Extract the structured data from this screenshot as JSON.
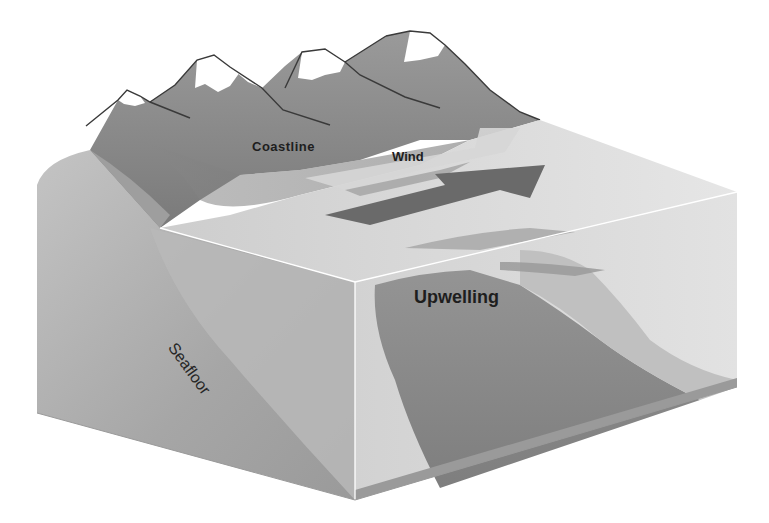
{
  "diagram": {
    "type": "3d-block-diagram",
    "labels": {
      "coastline": "Coastline",
      "wind": "Wind",
      "upwelling": "Upwelling",
      "seafloor": "Seafloor"
    },
    "colors": {
      "background": "#ffffff",
      "mountain": "#8e8e8e",
      "mountain_snow": "#ffffff",
      "mountain_outline": "#3a3a3a",
      "slope_left": "#a8a8a8",
      "slope_shadow": "#7c7c7c",
      "water_surface": "#dadada",
      "water_front_face": "#c9c9c9",
      "water_right_face": "#dedede",
      "wind_arrow": "#6a6a6a",
      "wind_arrow_light": "#d9d9d9",
      "upwelling_plume": "#8a8a8a",
      "upwelling_flow": "#a0a0a0",
      "seafloor_floor": "#b2b2b2",
      "edge_line": "#ffffff",
      "text": "#1e1e1e"
    },
    "elements": [
      "mountain-range",
      "coastline-slope",
      "water-block",
      "wind-arrow",
      "upwelling-plume",
      "seafloor-slope"
    ]
  }
}
